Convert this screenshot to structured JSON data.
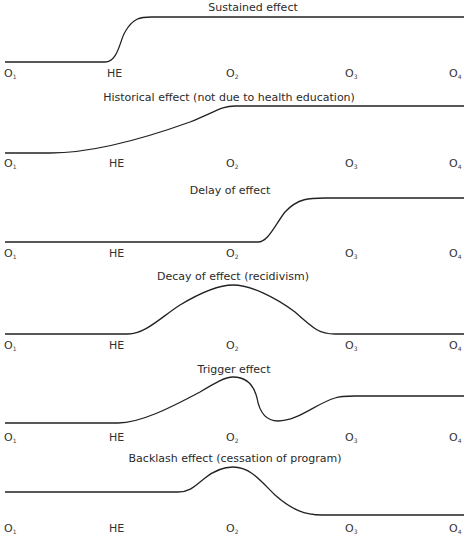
{
  "observation_labels": [
    "O1",
    "HE",
    "O2",
    "O3",
    "O4"
  ],
  "panels": [
    {
      "title": "Sustained effect",
      "labels": {
        "o1": "O",
        "o1_sub": "1",
        "he": "HE",
        "o2": "O",
        "o2_sub": "2",
        "o3": "O",
        "o3_sub": "3",
        "o4": "O",
        "o4_sub": "4"
      },
      "path": "M5,62 L105,62 C118,62 120,40 125,32 C133,18 140,17 152,17 L464,17"
    },
    {
      "title": "Historical effect (not due to health education)",
      "labels": {
        "o1": "O",
        "o1_sub": "1",
        "he": "HE",
        "o2": "O",
        "o2_sub": "2",
        "o3": "O",
        "o3_sub": "3",
        "o4": "O",
        "o4_sub": "4"
      },
      "path": "M5,153 L50,153 C90,153 140,140 190,122 C215,112 222,106 235,106 L464,106"
    },
    {
      "title": "Delay of effect",
      "labels": {
        "o1": "O",
        "o1_sub": "1",
        "he": "HE",
        "o2": "O",
        "o2_sub": "2",
        "o3": "O",
        "o3_sub": "3",
        "o4": "O",
        "o4_sub": "4"
      },
      "path": "M5,242 L258,242 C268,242 275,225 285,212 C298,198 310,198 325,198 L464,198"
    },
    {
      "title": "Decay of effect (recidivism)",
      "labels": {
        "o1": "O",
        "o1_sub": "1",
        "he": "HE",
        "o2": "O",
        "o2_sub": "2",
        "o3": "O",
        "o3_sub": "3",
        "o4": "O",
        "o4_sub": "4"
      },
      "path": "M5,334 L128,334 C145,334 160,318 180,305 C205,290 220,285 233,285 C250,285 275,297 295,312 C315,330 320,334 335,334 L464,334"
    },
    {
      "title": "Trigger effect",
      "labels": {
        "o1": "O",
        "o1_sub": "1",
        "he": "HE",
        "o2": "O",
        "o2_sub": "2",
        "o3": "O",
        "o3_sub": "3",
        "o4": "O",
        "o4_sub": "4"
      },
      "path": "M5,423 L118,423 C140,423 170,408 200,392 C215,383 225,377 233,377 C250,377 255,390 257,398 C260,415 268,421 278,421 C298,421 315,404 335,398 C340,396 345,396 355,396 L464,396"
    },
    {
      "title": "Backlash effect (cessation of program)",
      "labels": {
        "o1": "O",
        "o1_sub": "1",
        "he": "HE",
        "o2": "O",
        "o2_sub": "2",
        "o3": "O",
        "o3_sub": "3",
        "o4": "O",
        "o4_sub": "4"
      },
      "path": "M5,492 L178,492 C190,492 195,486 205,478 C215,470 225,467 233,467 C250,467 260,480 275,495 C292,510 305,515 322,515 L464,515"
    }
  ],
  "footer_caption": ""
}
